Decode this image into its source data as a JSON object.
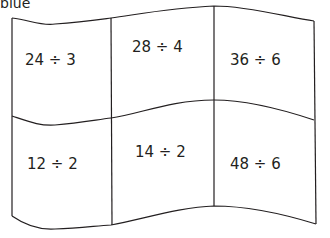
{
  "header": {
    "label": "blue"
  },
  "flag": {
    "cells": [
      {
        "text": "24 ÷ 3"
      },
      {
        "text": "28 ÷ 4"
      },
      {
        "text": "36 ÷ 6"
      },
      {
        "text": "12 ÷ 2"
      },
      {
        "text": "14 ÷ 2"
      },
      {
        "text": "48 ÷ 6"
      }
    ]
  }
}
